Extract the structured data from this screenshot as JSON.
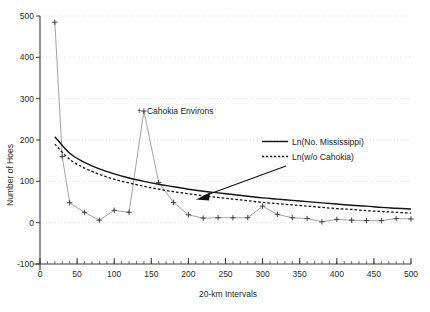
{
  "chart_data": {
    "type": "line",
    "title": "",
    "xlabel": "20-km Intervals",
    "ylabel": "Number of Hoes",
    "xlim": [
      0,
      500
    ],
    "ylim": [
      -100,
      500
    ],
    "xticks": [
      0,
      50,
      100,
      150,
      200,
      250,
      300,
      350,
      400,
      450,
      500
    ],
    "yticks": [
      -100,
      0,
      100,
      200,
      300,
      400,
      500
    ],
    "xtick_labels": [
      "0",
      "50",
      "100",
      "150",
      "200",
      "250",
      "300",
      "350",
      "400",
      "450",
      "500"
    ],
    "ytick_labels": [
      "-100",
      "0",
      "100",
      "200",
      "300",
      "400",
      "500"
    ],
    "xminor_step": 10,
    "grid": "horizontal-dotted",
    "legend_position": "upper-right-inside",
    "series": [
      {
        "name": "Observed hoes",
        "type": "scatter-line",
        "marker": "plus",
        "x": [
          20,
          30,
          40,
          60,
          80,
          100,
          120,
          140,
          160,
          180,
          200,
          220,
          240,
          260,
          280,
          300,
          320,
          340,
          360,
          380,
          400,
          420,
          440,
          460,
          480,
          500
        ],
        "y": [
          485,
          160,
          48,
          25,
          6,
          30,
          25,
          270,
          97,
          49,
          19,
          11,
          12,
          12,
          12,
          40,
          20,
          12,
          10,
          2,
          8,
          6,
          5,
          5,
          10,
          9
        ]
      },
      {
        "name": "Ln(No. Mississippi)",
        "type": "fit-curve-solid",
        "x": [
          20,
          40,
          60,
          80,
          100,
          120,
          140,
          160,
          180,
          200,
          220,
          240,
          260,
          280,
          300,
          320,
          340,
          360,
          380,
          400,
          420,
          440,
          460,
          480,
          500
        ],
        "y": [
          208,
          168,
          146,
          130,
          118,
          108,
          100,
          93,
          87,
          81,
          76,
          72,
          68,
          64,
          60,
          57,
          54,
          51,
          48,
          45,
          42,
          40,
          37,
          35,
          33
        ]
      },
      {
        "name": "Ln(w/o Cahokia)",
        "type": "fit-curve-dashed",
        "x": [
          20,
          40,
          60,
          80,
          100,
          120,
          140,
          160,
          180,
          200,
          220,
          240,
          260,
          280,
          300,
          320,
          340,
          360,
          380,
          400,
          420,
          440,
          460,
          480,
          500
        ],
        "y": [
          190,
          153,
          132,
          117,
          105,
          96,
          88,
          81,
          75,
          70,
          65,
          61,
          57,
          53,
          49,
          46,
          43,
          40,
          37,
          34,
          32,
          29,
          27,
          25,
          23
        ]
      }
    ],
    "annotations": [
      {
        "text": "Cahokia Environs",
        "marker": "+",
        "x_data": 140,
        "y_data": 270,
        "note": "label to right of spike peak"
      }
    ],
    "legend": [
      {
        "label": "Ln(No. Mississippi)",
        "style": "solid"
      },
      {
        "label": "Ln(w/o Cahokia)",
        "style": "dotted"
      }
    ],
    "arrow": {
      "from_label": "legend",
      "to_target": "fitted curves"
    }
  }
}
